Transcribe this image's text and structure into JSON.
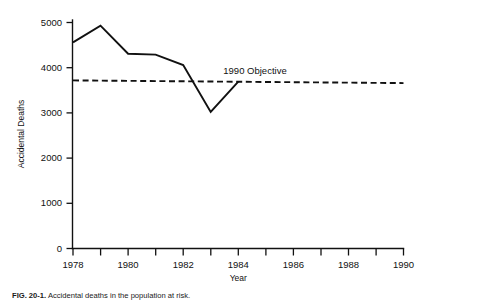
{
  "chart_data": {
    "type": "line",
    "title": "",
    "xlabel": "Year",
    "ylabel": "Accidental Deaths",
    "xlim": [
      1977.5,
      1990.5
    ],
    "ylim": [
      0,
      5000
    ],
    "grid": false,
    "legend_position": "inline-annotation",
    "x_ticks": [
      1978,
      1979,
      1980,
      1981,
      1982,
      1983,
      1984,
      1985,
      1986,
      1987,
      1988,
      1989,
      1990
    ],
    "x_tick_labels": [
      "1978",
      "",
      "1980",
      "",
      "1982",
      "",
      "1984",
      "",
      "1986",
      "",
      "1988",
      "",
      "1990"
    ],
    "y_ticks": [
      0,
      1000,
      2000,
      3000,
      4000,
      5000
    ],
    "y_tick_labels": [
      "0",
      "1000",
      "2000",
      "3000",
      "4000",
      "5000"
    ],
    "series": [
      {
        "name": "Accidental Deaths",
        "style": "solid",
        "x": [
          1978,
          1979,
          1980,
          1981,
          1982,
          1983,
          1984
        ],
        "values": [
          4560,
          4930,
          4310,
          4290,
          4060,
          3020,
          3690
        ]
      },
      {
        "name": "1990 Objective",
        "style": "dashed",
        "x": [
          1978,
          1990
        ],
        "values": [
          3720,
          3660
        ]
      }
    ],
    "annotations": [
      {
        "text": "1990 Objective",
        "x": 1986.0,
        "y": 4000
      }
    ]
  },
  "axes": {
    "y_label": "Accidental Deaths",
    "x_label": "Year"
  },
  "caption": {
    "id": "FIG. 20-1.",
    "text": "Accidental deaths in the population at risk."
  },
  "colors": {
    "foreground": "#111111",
    "background": "#ffffff"
  }
}
